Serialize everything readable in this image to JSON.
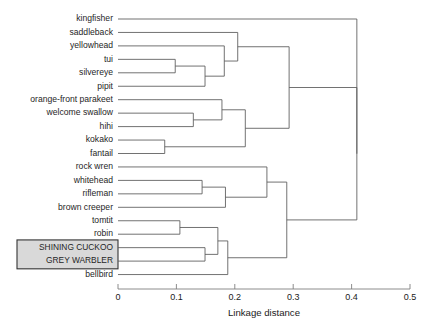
{
  "chart_data": {
    "type": "dendrogram",
    "title": "",
    "xlabel": "Linkage distance",
    "ylabel": "",
    "xlim": [
      0,
      0.5
    ],
    "xticks": [
      0,
      0.1,
      0.2,
      0.3,
      0.4,
      0.5
    ],
    "xticklabels": [
      "0",
      "0.1",
      "0.2",
      "0.3",
      "0.4",
      "0.5"
    ],
    "grid": false,
    "legend": "none",
    "orientation": "horizontal-left-to-right",
    "leaves": [
      {
        "label": "kingfisher",
        "highlighted": false
      },
      {
        "label": "saddleback",
        "highlighted": false
      },
      {
        "label": "yellowhead",
        "highlighted": false
      },
      {
        "label": "tui",
        "highlighted": false
      },
      {
        "label": "silvereye",
        "highlighted": false
      },
      {
        "label": "pipit",
        "highlighted": false
      },
      {
        "label": "orange-front parakeet",
        "highlighted": false
      },
      {
        "label": "welcome swallow",
        "highlighted": false
      },
      {
        "label": "hihi",
        "highlighted": false
      },
      {
        "label": "kokako",
        "highlighted": false
      },
      {
        "label": "fantail",
        "highlighted": false
      },
      {
        "label": "rock wren",
        "highlighted": false
      },
      {
        "label": "whitehead",
        "highlighted": false
      },
      {
        "label": "rifleman",
        "highlighted": false
      },
      {
        "label": "brown creeper",
        "highlighted": false
      },
      {
        "label": "tomtit",
        "highlighted": false
      },
      {
        "label": "robin",
        "highlighted": false
      },
      {
        "label": "SHINING CUCKOO",
        "highlighted": true
      },
      {
        "label": "GREY WARBLER",
        "highlighted": true
      },
      {
        "label": "bellbird",
        "highlighted": false
      }
    ],
    "merges": [
      {
        "id": "m1",
        "left": "tui",
        "right": "silvereye",
        "distance": 0.098
      },
      {
        "id": "m2",
        "left": "m1",
        "right": "pipit",
        "distance": 0.149
      },
      {
        "id": "m3",
        "left": "yellowhead",
        "right": "m2",
        "distance": 0.182
      },
      {
        "id": "m4",
        "left": "saddleback",
        "right": "m3",
        "distance": 0.205
      },
      {
        "id": "m5",
        "left": "welcome swallow",
        "right": "hihi",
        "distance": 0.129
      },
      {
        "id": "m6",
        "left": "orange-front parakeet",
        "right": "m5",
        "distance": 0.178
      },
      {
        "id": "m7",
        "left": "kokako",
        "right": "fantail",
        "distance": 0.08
      },
      {
        "id": "m8",
        "left": "m6",
        "right": "m7",
        "distance": 0.218
      },
      {
        "id": "m9",
        "left": "m4",
        "right": "m8",
        "distance": 0.293
      },
      {
        "id": "m10",
        "left": "whitehead",
        "right": "rifleman",
        "distance": 0.144
      },
      {
        "id": "m11",
        "left": "m10",
        "right": "brown creeper",
        "distance": 0.184
      },
      {
        "id": "m12",
        "left": "rock wren",
        "right": "m11",
        "distance": 0.255
      },
      {
        "id": "m13",
        "left": "tomtit",
        "right": "robin",
        "distance": 0.106
      },
      {
        "id": "m14",
        "left": "SHINING CUCKOO",
        "right": "GREY WARBLER",
        "distance": 0.149
      },
      {
        "id": "m15",
        "left": "m13",
        "right": "m14",
        "distance": 0.171
      },
      {
        "id": "m16",
        "left": "m15",
        "right": "bellbird",
        "distance": 0.188
      },
      {
        "id": "m17",
        "left": "m12",
        "right": "m16",
        "distance": 0.289
      },
      {
        "id": "m18",
        "left": "m9",
        "right": "m17",
        "distance": 0.409
      },
      {
        "id": "m19",
        "left": "kingfisher",
        "right": "m18",
        "distance": 0.409
      }
    ]
  }
}
